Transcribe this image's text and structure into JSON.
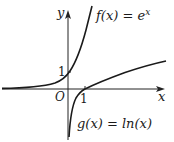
{
  "diagram": {
    "axes": {
      "x_label": "x",
      "y_label": "y",
      "origin_label": "O",
      "x_tick_label": "1",
      "y_tick_label": "1"
    },
    "curves": [
      {
        "name": "f",
        "label": "f(x) = e^x",
        "label_main": "f(x) = e",
        "label_exp": "x",
        "passes_through": [
          0,
          1
        ]
      },
      {
        "name": "g",
        "label": "g(x) = ln(x)",
        "passes_through": [
          1,
          0
        ]
      }
    ],
    "colors": {
      "curve": "#1a1a1a",
      "axis": "#222222",
      "background": "#ffffff"
    }
  }
}
